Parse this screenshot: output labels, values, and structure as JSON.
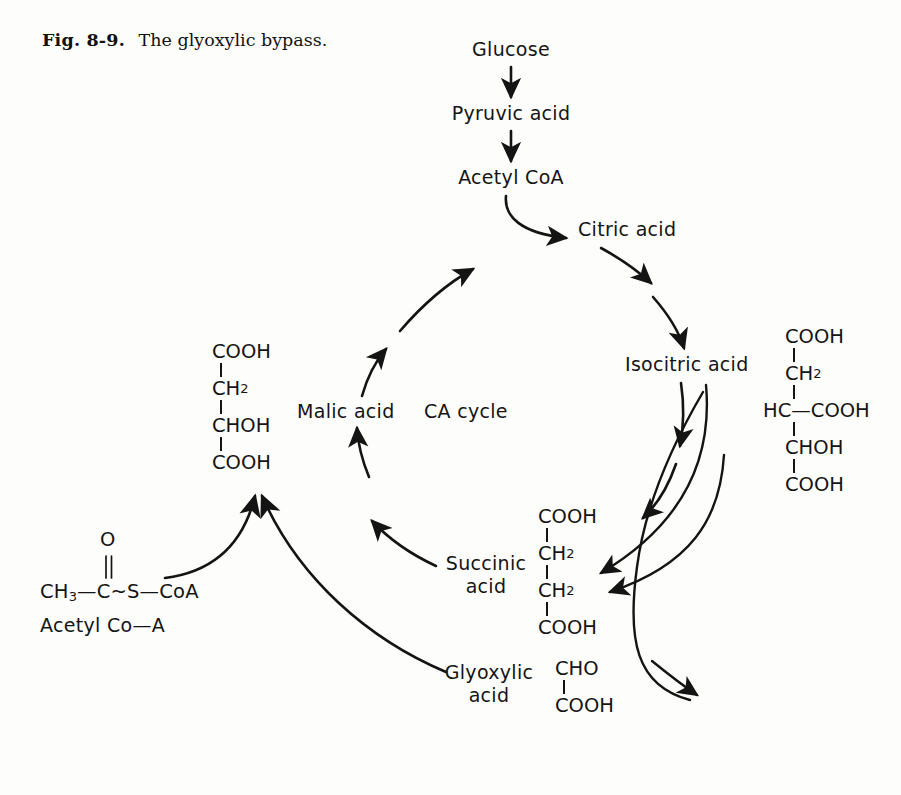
{
  "figure": {
    "caption_label": "Fig. 8-9.",
    "caption_text": "The glyoxylic bypass.",
    "ink_color": "#141414",
    "background_color": "#fdfdfb"
  },
  "entry_pathway": {
    "nodes": [
      {
        "id": "glucose",
        "label": "Glucose"
      },
      {
        "id": "pyruvic-acid",
        "label": "Pyruvic acid"
      },
      {
        "id": "acetyl-coa",
        "label": "Acetyl CoA"
      }
    ]
  },
  "cycle": {
    "center_label": "CA cycle",
    "nodes": [
      {
        "id": "citric-acid",
        "label": "Citric acid"
      },
      {
        "id": "isocitric-acid",
        "label": "Isocitric acid"
      },
      {
        "id": "succinic-acid",
        "label": "Succinic\nacid",
        "line1": "Succinic",
        "line2": "acid"
      },
      {
        "id": "malic-acid",
        "label": "Malic acid"
      }
    ]
  },
  "bypass": {
    "nodes": [
      {
        "id": "glyoxylic-acid",
        "label": "Glyoxylic\nacid",
        "line1": "Glyoxylic",
        "line2": "acid"
      }
    ]
  },
  "structures": {
    "malic_acid": {
      "name": "malic-acid-structure",
      "rows": [
        "COOH",
        "CH2",
        "CHOH",
        "COOH"
      ],
      "display": [
        {
          "text": "COOH",
          "sub": ""
        },
        {
          "text": "CH",
          "sub": "2"
        },
        {
          "text": "CHOH",
          "sub": ""
        },
        {
          "text": "COOH",
          "sub": ""
        }
      ]
    },
    "isocitric_acid": {
      "name": "isocitric-acid-structure",
      "rows": [
        "COOH",
        "CH2",
        "HC-COOH",
        "CHOH",
        "COOH"
      ],
      "display": [
        {
          "text": "COOH",
          "sub": ""
        },
        {
          "text": "CH",
          "sub": "2"
        },
        {
          "text": "HC—COOH",
          "sub": ""
        },
        {
          "text": "CHOH",
          "sub": ""
        },
        {
          "text": "COOH",
          "sub": ""
        }
      ]
    },
    "succinic_acid": {
      "name": "succinic-acid-structure",
      "rows": [
        "COOH",
        "CH2",
        "CH2",
        "COOH"
      ],
      "display": [
        {
          "text": "COOH",
          "sub": ""
        },
        {
          "text": "CH",
          "sub": "2"
        },
        {
          "text": "CH",
          "sub": "2"
        },
        {
          "text": "COOH",
          "sub": ""
        }
      ]
    },
    "glyoxylic_acid": {
      "name": "glyoxylic-acid-structure",
      "rows": [
        "CHO",
        "COOH"
      ],
      "display": [
        {
          "text": "CHO",
          "sub": ""
        },
        {
          "text": "COOH",
          "sub": ""
        }
      ]
    },
    "acetyl_coa": {
      "name": "acetyl-coa-structure",
      "oxygen": "O",
      "formula_prefix": "CH",
      "formula_sub": "3",
      "formula_rest": "—C~S—CoA",
      "caption": "Acetyl Co—A"
    }
  }
}
